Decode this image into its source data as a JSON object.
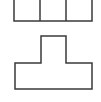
{
  "diagram": {
    "stroke_color": "#3a3a3a",
    "background": "#ffffff",
    "stroke_width": 1.5,
    "shapes": [
      {
        "name": "three-cell-rectangle",
        "type": "rect-grid",
        "x": 14,
        "y": -2,
        "width": 78,
        "height": 23,
        "dividers_x": [
          40,
          66
        ]
      },
      {
        "name": "t-shape",
        "type": "polygon",
        "points": "41,36 66,36 66,63 92,63 92,89 15,89 15,63 41,63"
      }
    ]
  }
}
